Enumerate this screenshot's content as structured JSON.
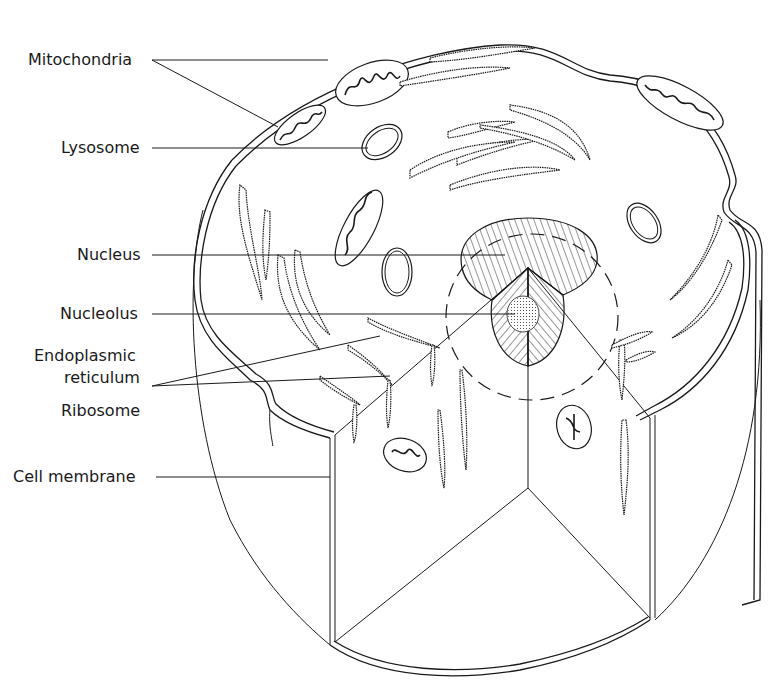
{
  "figure": {
    "labels": [
      {
        "id": "mitochondria",
        "text": "Mitochondria"
      },
      {
        "id": "lysosome",
        "text": "Lysosome"
      },
      {
        "id": "nucleus",
        "text": "Nucleus"
      },
      {
        "id": "nucleolus",
        "text": "Nucleolus"
      },
      {
        "id": "er_line1",
        "text": "Endoplasmic"
      },
      {
        "id": "er_line2",
        "text": "reticulum"
      },
      {
        "id": "ribosome",
        "text": "Ribosome"
      },
      {
        "id": "cell_membrane",
        "text": "Cell membrane"
      }
    ],
    "colors": {
      "ink": "#1a1a1a",
      "background": "#ffffff"
    }
  }
}
